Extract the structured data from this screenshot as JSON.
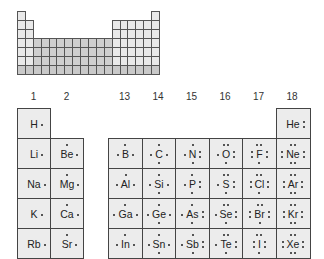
{
  "mini_table": {
    "rows": 7,
    "cols": 18,
    "colors": {
      "main": "#e9e9e9",
      "transition": "#cfcfcf",
      "border": "#555555"
    }
  },
  "groups": {
    "left": [
      "1",
      "2"
    ],
    "right": [
      "13",
      "14",
      "15",
      "16",
      "17",
      "18"
    ]
  },
  "elements": [
    {
      "symbol": "H",
      "group": 1,
      "period": 1,
      "valence": 1
    },
    {
      "symbol": "He",
      "group": 18,
      "period": 1,
      "valence": 2
    },
    {
      "symbol": "Li",
      "group": 1,
      "period": 2,
      "valence": 1
    },
    {
      "symbol": "Be",
      "group": 2,
      "period": 2,
      "valence": 2
    },
    {
      "symbol": "B",
      "group": 13,
      "period": 2,
      "valence": 3
    },
    {
      "symbol": "C",
      "group": 14,
      "period": 2,
      "valence": 4
    },
    {
      "symbol": "N",
      "group": 15,
      "period": 2,
      "valence": 5
    },
    {
      "symbol": "O",
      "group": 16,
      "period": 2,
      "valence": 6
    },
    {
      "symbol": "F",
      "group": 17,
      "period": 2,
      "valence": 7
    },
    {
      "symbol": "Ne",
      "group": 18,
      "period": 2,
      "valence": 8
    },
    {
      "symbol": "Na",
      "group": 1,
      "period": 3,
      "valence": 1
    },
    {
      "symbol": "Mg",
      "group": 2,
      "period": 3,
      "valence": 2
    },
    {
      "symbol": "Al",
      "group": 13,
      "period": 3,
      "valence": 3
    },
    {
      "symbol": "Si",
      "group": 14,
      "period": 3,
      "valence": 4
    },
    {
      "symbol": "P",
      "group": 15,
      "period": 3,
      "valence": 5
    },
    {
      "symbol": "S",
      "group": 16,
      "period": 3,
      "valence": 6
    },
    {
      "symbol": "Cl",
      "group": 17,
      "period": 3,
      "valence": 7
    },
    {
      "symbol": "Ar",
      "group": 18,
      "period": 3,
      "valence": 8
    },
    {
      "symbol": "K",
      "group": 1,
      "period": 4,
      "valence": 1
    },
    {
      "symbol": "Ca",
      "group": 2,
      "period": 4,
      "valence": 2
    },
    {
      "symbol": "Ga",
      "group": 13,
      "period": 4,
      "valence": 3
    },
    {
      "symbol": "Ge",
      "group": 14,
      "period": 4,
      "valence": 4
    },
    {
      "symbol": "As",
      "group": 15,
      "period": 4,
      "valence": 5
    },
    {
      "symbol": "Se",
      "group": 16,
      "period": 4,
      "valence": 6
    },
    {
      "symbol": "Br",
      "group": 17,
      "period": 4,
      "valence": 7
    },
    {
      "symbol": "Kr",
      "group": 18,
      "period": 4,
      "valence": 8
    },
    {
      "symbol": "Rb",
      "group": 1,
      "period": 5,
      "valence": 1
    },
    {
      "symbol": "Sr",
      "group": 2,
      "period": 5,
      "valence": 2
    },
    {
      "symbol": "In",
      "group": 13,
      "period": 5,
      "valence": 3
    },
    {
      "symbol": "Sn",
      "group": 14,
      "period": 5,
      "valence": 4
    },
    {
      "symbol": "Sb",
      "group": 15,
      "period": 5,
      "valence": 5
    },
    {
      "symbol": "Te",
      "group": 16,
      "period": 5,
      "valence": 6
    },
    {
      "symbol": "I",
      "group": 17,
      "period": 5,
      "valence": 7
    },
    {
      "symbol": "Xe",
      "group": 18,
      "period": 5,
      "valence": 8
    }
  ]
}
